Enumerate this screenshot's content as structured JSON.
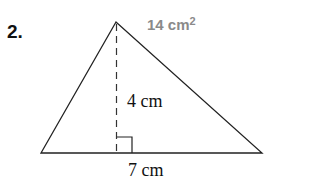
{
  "problem": {
    "number": "2.",
    "answer_value": "14 cm",
    "answer_exponent": "2",
    "answer_color": "#8a8a8a"
  },
  "figure": {
    "shape": "triangle",
    "height_label": "4 cm",
    "base_label": "7 cm",
    "vertices": {
      "apex": [
        116,
        22
      ],
      "bottom_left": [
        41,
        153
      ],
      "bottom_right": [
        262,
        153
      ]
    },
    "right_angle_marker": true,
    "height_line_style": "dashed"
  }
}
